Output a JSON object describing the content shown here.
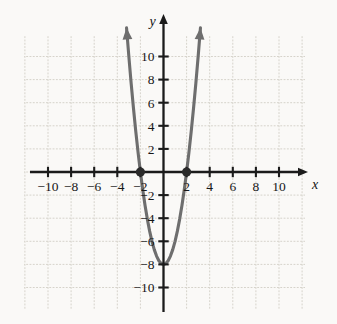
{
  "panel": {
    "label": "c."
  },
  "chart_data": {
    "type": "line",
    "title": "",
    "subtitle": "",
    "xlabel": "x",
    "ylabel": "y",
    "xlim": [
      -11.5,
      11.5
    ],
    "ylim": [
      -11.5,
      12.5
    ],
    "grid": true,
    "grid_step": 2,
    "legend": "none",
    "x_ticks": [
      -10,
      -8,
      -6,
      -4,
      -2,
      2,
      4,
      6,
      8,
      10
    ],
    "y_ticks": [
      -10,
      -8,
      -6,
      -4,
      -2,
      2,
      4,
      6,
      8,
      10
    ],
    "x_tick_labels": [
      "−10",
      "−8",
      "−6",
      "−4",
      "−2",
      "2",
      "4",
      "6",
      "8",
      "10"
    ],
    "y_tick_labels": [
      "−10",
      "−8",
      "−6",
      "−4",
      "−2",
      "2",
      "4",
      "6",
      "8",
      "10"
    ],
    "series": [
      {
        "name": "parabola",
        "equation": "y = 2x^2 - 8",
        "type": "parabola",
        "vertex": [
          0,
          -8
        ],
        "leading_coefficient": 2,
        "x": [
          -3.2,
          -3.0,
          -2.8,
          -2.6,
          -2.4,
          -2.2,
          -2.0,
          -1.8,
          -1.6,
          -1.4,
          -1.2,
          -1.0,
          -0.8,
          -0.6,
          -0.4,
          -0.2,
          0.0,
          0.2,
          0.4,
          0.6,
          0.8,
          1.0,
          1.2,
          1.4,
          1.6,
          1.8,
          2.0,
          2.2,
          2.4,
          2.6,
          2.8,
          3.0,
          3.2
        ],
        "values": [
          12.48,
          10.0,
          7.68,
          5.52,
          3.52,
          1.68,
          0.0,
          -1.52,
          -2.88,
          -4.08,
          -5.12,
          -6.0,
          -6.72,
          -7.28,
          -7.68,
          -7.92,
          -8.0,
          -7.92,
          -7.68,
          -7.28,
          -6.72,
          -6.0,
          -5.12,
          -4.08,
          -2.88,
          -1.52,
          0.0,
          1.68,
          3.52,
          5.52,
          7.68,
          10.0,
          12.48
        ],
        "color": "#6e6e6e",
        "arrow_start": true,
        "arrow_end": true
      }
    ],
    "points": [
      {
        "name": "x-intercept-left",
        "x": -2,
        "y": 0,
        "style": "filled-dot"
      },
      {
        "name": "x-intercept-right",
        "x": 2,
        "y": 0,
        "style": "filled-dot"
      }
    ],
    "annotations": []
  },
  "colors": {
    "background": "#faf9f7",
    "grid": "#d9d6cf",
    "axis": "#1b1b1b",
    "curve": "#6e6e6e",
    "point": "#2a2a2a",
    "text": "#141414"
  }
}
